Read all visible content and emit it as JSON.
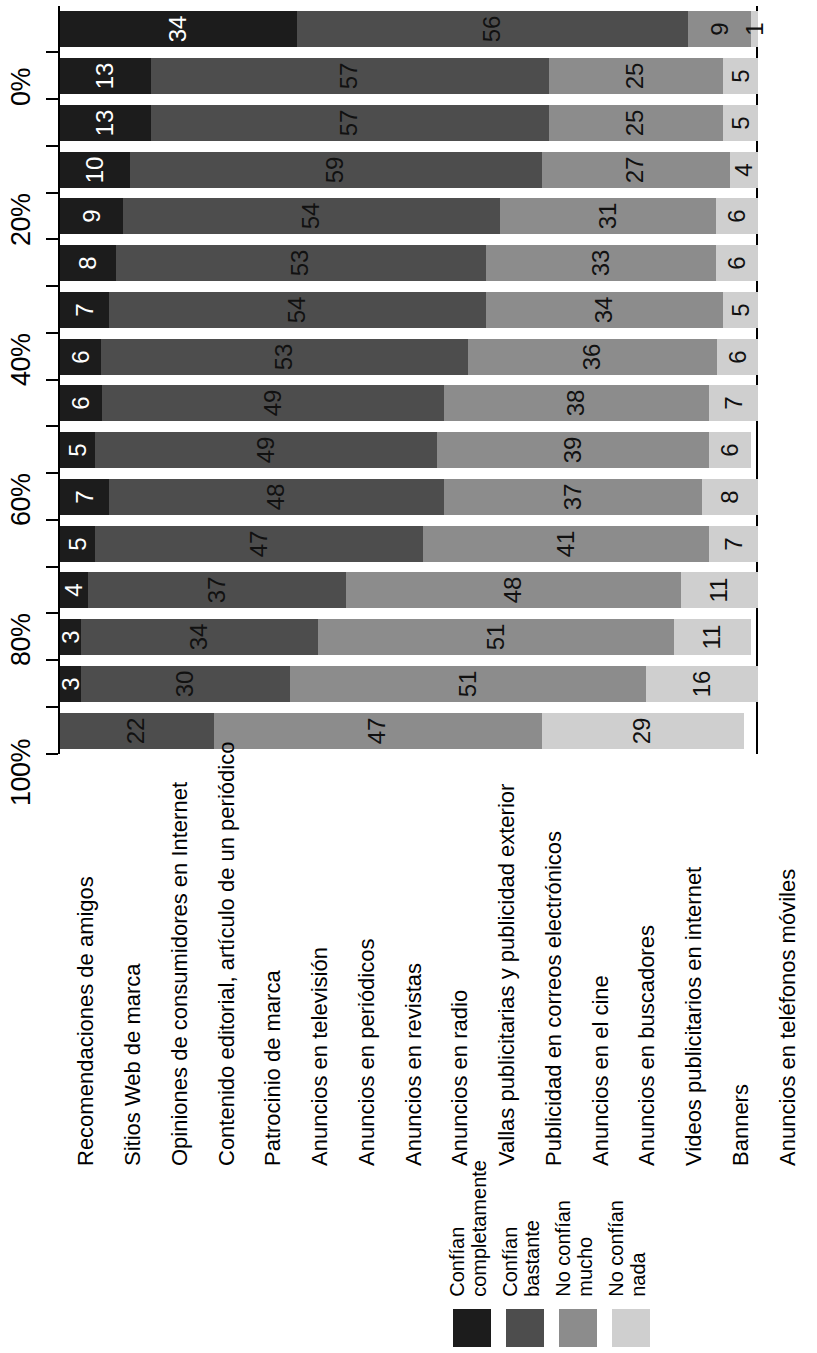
{
  "chart_data": {
    "type": "bar",
    "subtype": "stacked-horizontal-percent",
    "title": "",
    "xlabel": "",
    "ylabel": "",
    "ylim": [
      0,
      100
    ],
    "grid": false,
    "legend_position": "bottom-right",
    "axis_ticks": [
      "0%",
      "20%",
      "40%",
      "60%",
      "80%",
      "100%"
    ],
    "axis_tick_values": [
      0,
      20,
      40,
      60,
      80,
      100
    ],
    "categories": [
      "Recomendaciones de amigos",
      "Sitios Web de marca",
      "Opiniones de consumidores en Internet",
      "Contenido editorial, artículo de un periódico",
      "Patrocinio de marca",
      "Anuncios en televisión",
      "Anuncios en periódicos",
      "Anuncios en revistas",
      "Anuncios en radio",
      "Vallas publicitarias y publicidad exterior",
      "Publicidad en correos electrónicos",
      "Anuncios en el cine",
      "Anuncios en buscadores",
      "Videos publicitarios en internet",
      "Banners",
      "Anuncios en teléfonos móviles"
    ],
    "series": [
      {
        "name": "Confían completamente",
        "color": "#1c1c1c",
        "values": [
          34,
          13,
          13,
          10,
          9,
          8,
          7,
          6,
          6,
          5,
          7,
          5,
          4,
          3,
          3,
          0
        ]
      },
      {
        "name": "Confían bastante",
        "color": "#4d4d4d",
        "values": [
          56,
          57,
          57,
          59,
          54,
          53,
          54,
          53,
          49,
          49,
          48,
          47,
          37,
          34,
          30,
          22
        ]
      },
      {
        "name": "No confían mucho",
        "color": "#8c8c8c",
        "values": [
          9,
          25,
          25,
          27,
          31,
          33,
          34,
          36,
          38,
          39,
          37,
          41,
          48,
          51,
          51,
          47
        ]
      },
      {
        "name": "No confían nada",
        "color": "#cfcfcf",
        "values": [
          1,
          5,
          5,
          4,
          6,
          6,
          5,
          6,
          7,
          6,
          8,
          7,
          11,
          11,
          16,
          29
        ]
      }
    ]
  },
  "legend": {
    "items": [
      {
        "label_line1": "Confían",
        "label_line2": "completamente",
        "color": "#1c1c1c"
      },
      {
        "label_line1": "Confían",
        "label_line2": "bastante",
        "color": "#4d4d4d"
      },
      {
        "label_line1": "No confían",
        "label_line2": "mucho",
        "color": "#8c8c8c"
      },
      {
        "label_line1": "No confían",
        "label_line2": "nada",
        "color": "#cfcfcf"
      }
    ]
  }
}
